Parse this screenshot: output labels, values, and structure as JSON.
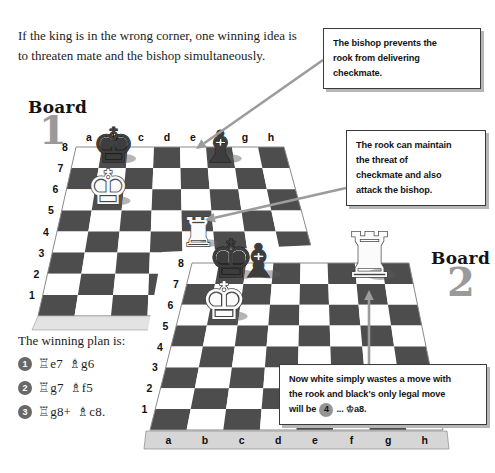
{
  "intro": {
    "line1": "If the king is in the wrong corner, one winning idea is",
    "line2": "to threaten mate and the bishop simultaneously."
  },
  "callouts": {
    "bishop_prevents": {
      "lines": [
        "The bishop prevents the",
        "rook from delivering",
        "checkmate."
      ]
    },
    "rook_threat": {
      "lines": [
        "The rook can maintain",
        "the threat of",
        "checkmate and also",
        "attack the bishop."
      ]
    },
    "waiting_move": {
      "line1": "Now white simply wastes a move with",
      "line2": "the rook and black's only legal move",
      "line3_prefix": "will be",
      "move_number": "4",
      "line3_suffix": "... ♔a8."
    }
  },
  "boards": [
    {
      "label": "Board",
      "number": "1",
      "files": [
        "a",
        "b",
        "c",
        "d",
        "e",
        "f",
        "g",
        "h"
      ],
      "ranks": [
        "8",
        "7",
        "6",
        "5",
        "4",
        "3",
        "2",
        "1"
      ],
      "pieces": [
        {
          "square": "b8",
          "type": "king",
          "color": "black"
        },
        {
          "square": "f8",
          "type": "bishop",
          "color": "black"
        },
        {
          "square": "b6",
          "type": "king",
          "color": "white"
        },
        {
          "square": "e4",
          "type": "rook",
          "color": "white"
        }
      ]
    },
    {
      "label": "Board",
      "number": "2",
      "files": [
        "a",
        "b",
        "c",
        "d",
        "e",
        "f",
        "g",
        "h"
      ],
      "ranks": [
        "8",
        "7",
        "6",
        "5",
        "4",
        "3",
        "2",
        "1"
      ],
      "pieces": [
        {
          "square": "b8",
          "type": "king",
          "color": "black"
        },
        {
          "square": "c8",
          "type": "bishop",
          "color": "black"
        },
        {
          "square": "b6",
          "type": "king",
          "color": "white"
        },
        {
          "square": "g8",
          "type": "rook",
          "color": "white"
        }
      ]
    }
  ],
  "plan": {
    "title": "The winning plan is:",
    "moves": [
      {
        "number": "1",
        "white": "♖e7",
        "black": "♗g6"
      },
      {
        "number": "2",
        "white": "♖g7",
        "black": "♗f5"
      },
      {
        "number": "3",
        "white": "♖g8+",
        "black": "♗c8."
      }
    ]
  },
  "colors": {
    "dark_square": "#4d4d4d",
    "light_square": "#ffffff",
    "board_front": "#e3e3e3",
    "letter_strip": "#d6d6d6",
    "arrow": "#9c9c9c",
    "board_number_gray": "#9a9a9a",
    "badge_dark": "#686868",
    "badge_light": "#949494",
    "white_piece": "#fbfbfb",
    "black_piece": "#3d3d3d"
  }
}
